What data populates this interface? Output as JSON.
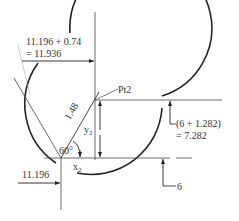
{
  "diagram": {
    "labels": {
      "top_dim_line1": "11.196 + 0.74",
      "top_dim_line2": "= 11.936",
      "point": "Pt2",
      "radius": "1.48",
      "angle": "60°",
      "y_var": "y",
      "y_sub": "2",
      "x_var": "x",
      "x_sub": "2",
      "left_dim": "11.196",
      "right_dim_line1": "(6 + 1.282)",
      "right_dim_line2": "= 7.282",
      "bottom_dim": "6"
    },
    "colors": {
      "stroke": "#222222",
      "thin": "#444444"
    }
  }
}
